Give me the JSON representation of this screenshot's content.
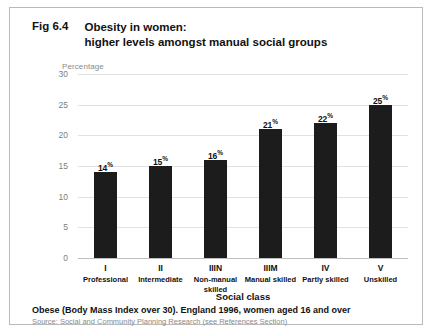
{
  "figure": {
    "number": "Fig 6.4",
    "title_line1": "Obesity in women:",
    "title_line2": "higher levels amongst manual social groups",
    "footnote": "Obese (Body Mass Index over 30).  England 1996, women aged 16 and over",
    "source": "Source: Social and Community Planning Research (see References Section)"
  },
  "chart_data": {
    "type": "bar",
    "title": "Obesity in women: higher levels amongst manual social groups",
    "xlabel": "Social class",
    "ylabel": "Percentage",
    "ylim": [
      0,
      30
    ],
    "yticks": [
      0,
      5,
      10,
      15,
      20,
      25,
      30
    ],
    "ytick_labels": [
      "0",
      "5",
      "10",
      "15",
      "20",
      "25",
      "30"
    ],
    "grid": true,
    "legend": "none",
    "bar_color": "#1c1c1c",
    "categories": [
      "I",
      "II",
      "IIIN",
      "IIIM",
      "IV",
      "V"
    ],
    "category_names": [
      "Professional",
      "Intermediate",
      "Non-manual skilled",
      "Manual skilled",
      "Partly skilled",
      "Unskilled"
    ],
    "values": [
      14,
      15,
      16,
      21,
      22,
      25
    ],
    "value_labels": [
      "14",
      "15",
      "16",
      "21",
      "22",
      "25"
    ],
    "value_suffix": "%"
  }
}
